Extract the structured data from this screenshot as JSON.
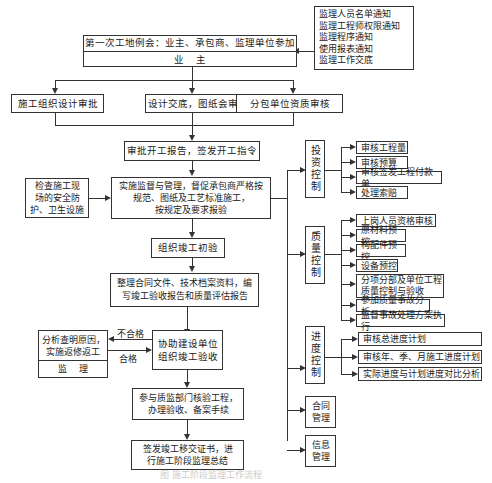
{
  "notices": {
    "lines": [
      "监理人员名单通知",
      "监理工程师权限通知",
      "监理程序通知",
      "使用报表通知",
      "监理工作交底"
    ]
  },
  "first_meeting": {
    "title": "第一次工地例会：业主、承包商、监理单位参加",
    "owner": "业    主"
  },
  "row2": {
    "design_review": "施工组织设计审批",
    "design_disclosure": "设计交底，图纸会审",
    "subcontract_review": "分包单位资质审核"
  },
  "start_approval": "审批开工报告，签发开工指令",
  "safety_check": [
    "检查施工现",
    "场的安全防",
    "护、卫生设施"
  ],
  "supervision": [
    "实施监督与管理，督促承包商严格按",
    "规范、图纸及工艺标准施工，",
    "按规定及要求报验"
  ],
  "initial_acceptance": "组织竣工初验",
  "documents": [
    "整理合同文件、技术档案资料，编",
    "写竣工验收报告和质量评估报告"
  ],
  "assist_acceptance": [
    "协助建设单位",
    "组织竣工验收"
  ],
  "rework": {
    "lines": [
      "分析查明原因，",
      "实施返修返工"
    ],
    "footer": "监    理"
  },
  "labels": {
    "fail": "不合格",
    "pass": "合格"
  },
  "quality_supervision": [
    "参与质监部门核验工程，",
    "办理验收、备案手续"
  ],
  "handover": [
    "签发竣工移交证书，进",
    "行施工阶段监理总结"
  ],
  "controls": [
    {
      "name": "投资控制",
      "items": [
        "审核工程量",
        "审核预算",
        "审核签发工程付款单",
        "处理索赔"
      ]
    },
    {
      "name": "质量控制",
      "items": [
        "上岗人员资格审核",
        "原材料预控",
        "构配件预控",
        "设备预控",
        "分项分部及单位工程\n质量控制与验收",
        "参加质量事故分析",
        "监督事故处理方案执行"
      ]
    },
    {
      "name": "进度控制",
      "items": [
        "审核总进度计划",
        "审核年、季、月施工进度计划",
        "实际进度与计划进度对比分析"
      ]
    },
    {
      "name": "合同管理",
      "items": []
    },
    {
      "name": "信息管理",
      "items": []
    }
  ],
  "caption": "图  施工阶段监理工作流程"
}
